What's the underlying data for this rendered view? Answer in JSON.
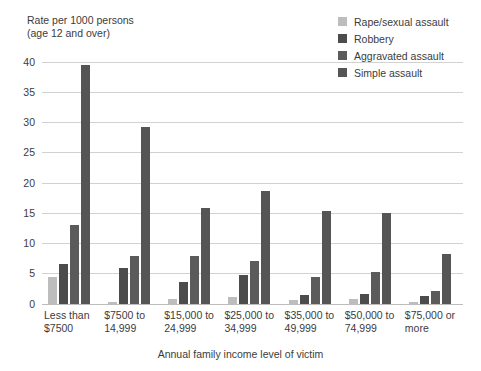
{
  "chart_data": {
    "type": "bar",
    "title": "Rate per 1000 persons\n(age 12 and over)",
    "ylabel": "Rate per 1000 persons (age 12 and over)",
    "xlabel": "Annual family income level of victim",
    "ylim": [
      0,
      40
    ],
    "yticks": [
      0,
      5,
      10,
      15,
      20,
      25,
      30,
      35,
      40
    ],
    "ytick_labels": [
      "0",
      "5",
      "10",
      "15",
      "20",
      "25",
      "30",
      "35",
      "40"
    ],
    "grid": true,
    "legend_position": "top-right",
    "categories": [
      "Less than\n$7500",
      "$7500 to\n14,999",
      "$15,000 to\n24,999",
      "$25,000 to\n34,999",
      "$35,000 to\n49,999",
      "$50,000 to\n74,999",
      "$75,000 or\nmore"
    ],
    "series": [
      {
        "name": "Rape/sexual assault",
        "color": "#bdbdbd",
        "values": [
          4.4,
          0.4,
          0.9,
          1.1,
          0.6,
          0.8,
          0.3
        ]
      },
      {
        "name": "Robbery",
        "color": "#4c4c4c",
        "values": [
          6.6,
          6.0,
          3.6,
          4.8,
          1.5,
          1.7,
          1.3
        ]
      },
      {
        "name": "Aggravated assault",
        "color": "#5b5b5b",
        "values": [
          13.0,
          8.0,
          7.9,
          7.1,
          4.4,
          5.3,
          2.2
        ]
      },
      {
        "name": "Simple assault",
        "color": "#555555",
        "values": [
          39.5,
          29.3,
          15.8,
          18.6,
          15.3,
          15.1,
          8.2
        ]
      }
    ]
  },
  "colors": {
    "gridline": "#d2d2d2",
    "baseline": "#bdbdbd",
    "text": "#3c3c3c",
    "background": "#ffffff"
  }
}
